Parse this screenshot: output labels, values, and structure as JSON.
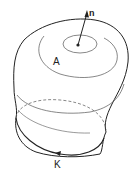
{
  "diagram": {
    "labels": {
      "normal": "n",
      "surface": "A",
      "boundary": "K"
    },
    "colors": {
      "stroke": "#222222",
      "contour": "#555555",
      "background": "#ffffff"
    }
  }
}
